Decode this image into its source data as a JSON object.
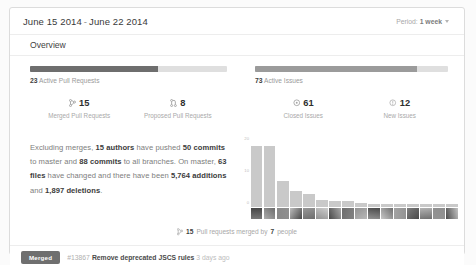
{
  "header": {
    "date_start": "June 15 2014",
    "date_separator": "-",
    "date_end": "June 22 2014",
    "period_label": "Period:",
    "period_value": "1 week",
    "period_caret_icon": "chevron-down-icon"
  },
  "overview": {
    "title": "Overview"
  },
  "pull_requests": {
    "meter_total": 23,
    "meter_filled": 15,
    "meter_percent": 65,
    "active_count": "23",
    "active_label": "Active Pull Requests",
    "merged": {
      "icon": "git-merge-icon",
      "value": "15",
      "caption": "Merged Pull Requests"
    },
    "proposed": {
      "icon": "git-pull-request-icon",
      "value": "8",
      "caption": "Proposed Pull Requests"
    }
  },
  "issues": {
    "meter_total": 73,
    "meter_filled": 61,
    "meter_percent": 84,
    "active_count": "73",
    "active_label": "Active Issues",
    "closed": {
      "icon": "issue-closed-icon",
      "value": "61",
      "caption": "Closed Issues"
    },
    "new": {
      "icon": "issue-opened-icon",
      "value": "12",
      "caption": "New Issues"
    }
  },
  "summary": {
    "text_parts": [
      {
        "t": "Excluding merges, ",
        "b": false
      },
      {
        "t": "15 authors",
        "b": true
      },
      {
        "t": " have pushed ",
        "b": false
      },
      {
        "t": "50 commits",
        "b": true
      },
      {
        "t": " to master and ",
        "b": false
      },
      {
        "t": "88 commits",
        "b": true
      },
      {
        "t": " to all branches. On master, ",
        "b": false
      },
      {
        "t": "63 files",
        "b": true
      },
      {
        "t": " have changed and there have been ",
        "b": false
      },
      {
        "t": "5,764 additions",
        "b": true
      },
      {
        "t": " and ",
        "b": false
      },
      {
        "t": "1,897 deletions",
        "b": true
      },
      {
        "t": ".",
        "b": false
      }
    ],
    "authors": "15",
    "commits_master": "50",
    "commits_all": "88",
    "files_changed": "63",
    "additions": "5,764",
    "deletions": "1,897"
  },
  "merged_by": {
    "icon": "git-merge-icon",
    "count": "15",
    "mid_text": "Pull requests merged by",
    "people": "7",
    "people_word": "people"
  },
  "pull_request_item": {
    "status_badge": "Merged",
    "number": "#13867",
    "title": "Remove deprecated JSCS rules",
    "timestamp": "3 days ago"
  },
  "chart_data": {
    "type": "bar",
    "title": "",
    "xlabel": "",
    "ylabel": "",
    "ylim": [
      0,
      20
    ],
    "grid": false,
    "legend": false,
    "yticks": [
      0,
      10,
      20
    ],
    "categories": [
      "c1",
      "c2",
      "c3",
      "c4",
      "c5",
      "c6",
      "c7",
      "c8",
      "c9",
      "c10",
      "c11",
      "c12",
      "c13",
      "c14",
      "c15",
      "c16"
    ],
    "values": [
      19,
      19,
      8,
      5,
      4,
      2,
      1.6,
      1.6,
      1,
      0.8,
      0.8,
      0.8,
      0.8,
      0.8,
      0.8,
      0.8
    ]
  },
  "colors": {
    "bar": "#c9c9c9",
    "meter_track": "#dfdfdf",
    "meter_fill_dark": "#6e6e6e",
    "meter_fill_light": "#9b9b9b",
    "badge": "#6f6f6f",
    "card_border": "#dcdcdc",
    "text_primary": "#3c3c3c",
    "text_muted": "#a9a9a9"
  }
}
